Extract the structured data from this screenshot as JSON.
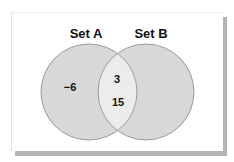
{
  "diagram": {
    "type": "venn",
    "sets": [
      {
        "id": "A",
        "label": "Set A",
        "only_elements": [
          "−6"
        ]
      },
      {
        "id": "B",
        "label": "Set B",
        "only_elements": []
      }
    ],
    "intersection": {
      "elements": [
        "3",
        "15"
      ]
    },
    "colors": {
      "circle_fill": "#d8d8d8",
      "intersection_fill": "#ececec",
      "circle_stroke": "#9a9a9a",
      "frame_shadow": "#b4b4b4"
    }
  }
}
